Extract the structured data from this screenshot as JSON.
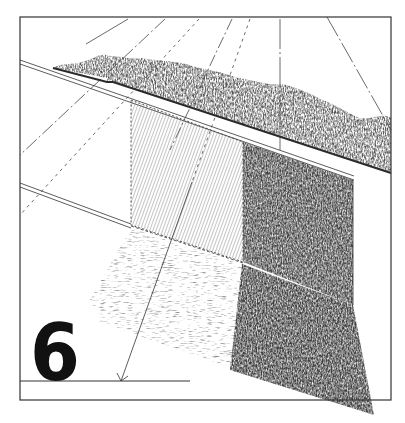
{
  "figure": {
    "number": "6"
  },
  "colors": {
    "ink": "#222222",
    "frame": "#333333",
    "paper": "#ffffff",
    "hedge": "#5a5a5a",
    "dark_panel": "#4a4a4a",
    "shadow": "#3d3d3d",
    "light_hatch": "#9a9a9a"
  },
  "elements": [
    {
      "name": "frame",
      "label": "Figure frame"
    },
    {
      "name": "hedge",
      "label": "Hedge backdrop"
    },
    {
      "name": "hatched-panel",
      "label": "Light hatched wall panel"
    },
    {
      "name": "dark-panel",
      "label": "Dark textured wall panel"
    },
    {
      "name": "cast-shadow",
      "label": "Cast shadow on ground"
    },
    {
      "name": "perspective-lines",
      "label": "Perspective construction lines"
    },
    {
      "name": "baseline",
      "label": "Ground baseline with arrow"
    }
  ]
}
